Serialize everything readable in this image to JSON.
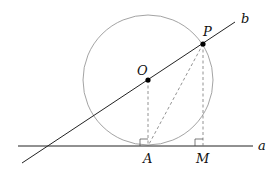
{
  "diagram": {
    "labels": {
      "O": "O",
      "P": "P",
      "A": "A",
      "M": "M",
      "line_a": "a",
      "line_b": "b"
    },
    "colors": {
      "lines": "#222222",
      "circle": "#999999",
      "dashed": "#777777",
      "points": "#000000"
    }
  }
}
